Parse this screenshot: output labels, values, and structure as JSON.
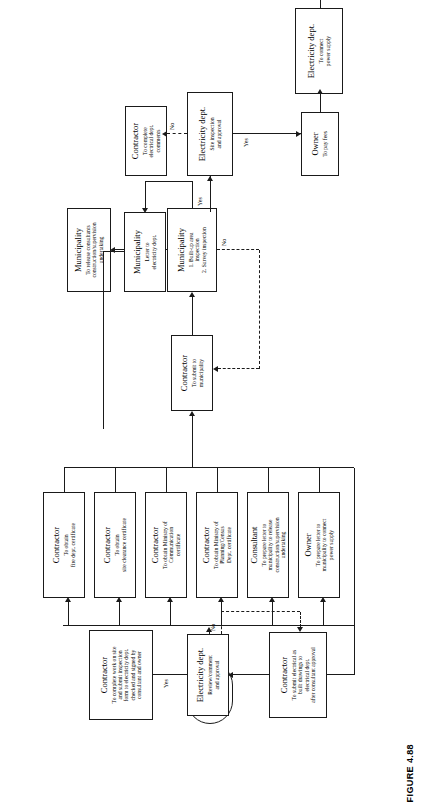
{
  "figure": {
    "caption": "FIGURE 4.88"
  },
  "diagram": {
    "orientation": "rotated-90-ccw",
    "type": "flowchart",
    "start": {
      "label": "Start"
    },
    "end": {
      "label": "End"
    },
    "nodes": [
      {
        "id": "contractor-fire",
        "title": "Contractor",
        "lines": [
          "To obtain",
          "fire dept. certificate"
        ]
      },
      {
        "id": "contractor-site",
        "title": "Contractor",
        "lines": [
          "To obtain",
          "site clearance certificate"
        ]
      },
      {
        "id": "contractor-comm",
        "title": "Contractor",
        "lines": [
          "To obtain Ministry of",
          "Communication",
          "certificate"
        ]
      },
      {
        "id": "contractor-planning",
        "title": "Contractor",
        "lines": [
          "To obtain Ministry of",
          "Planning/Census",
          "Dept. certificate"
        ]
      },
      {
        "id": "consultant-release",
        "title": "Consultant",
        "lines": [
          "To prepare letter to",
          "municipality to release",
          "construction/supervision",
          "undertaking"
        ]
      },
      {
        "id": "owner-connect",
        "title": "Owner",
        "lines": [
          "To prepare letter to",
          "municipality to connect",
          "power supply"
        ]
      },
      {
        "id": "contractor-asbuilt",
        "title": "Contractor",
        "lines": [
          "To submit electrical as",
          "built drawings to",
          "electrical dept.",
          "after consultant approval"
        ]
      },
      {
        "id": "elec-review",
        "title": "Electricity dept.",
        "lines": [
          "Review/comment",
          "and approval"
        ]
      },
      {
        "id": "contractor-complete",
        "title": "Contractor",
        "lines": [
          "To complete work on site",
          "and submit inspection",
          "form to electricity dept.",
          "checked and signed by",
          "consultant and owner"
        ]
      },
      {
        "id": "elec-site-inspection",
        "title": "Electricity dept.",
        "lines": [
          "Site inspection",
          "and approval"
        ]
      },
      {
        "id": "contractor-comments",
        "title": "Contractor",
        "lines": [
          "To complete",
          "electrical dept.",
          "comments"
        ]
      },
      {
        "id": "contractor-submit-muni",
        "title": "Contractor",
        "lines": [
          "To submit to",
          "municipality"
        ]
      },
      {
        "id": "municipality-inspect",
        "title": "Municipality",
        "lines": [
          "1. Built-up area",
          "inspection",
          "2. Survey inspection"
        ]
      },
      {
        "id": "municipality-release",
        "title": "Municipality",
        "lines": [
          "To release consultants",
          "construction/supervision",
          "undertaking"
        ]
      },
      {
        "id": "municipality-letter",
        "title": "Municipality",
        "lines": [
          "Letter to",
          "electricity dept."
        ]
      },
      {
        "id": "owner-fees",
        "title": "Owner",
        "lines": [
          "To pay fees"
        ]
      },
      {
        "id": "elec-connect",
        "title": "Electricity dept.",
        "lines": [
          "To connect",
          "power supply"
        ]
      }
    ],
    "edge_labels": {
      "elec_review_yes": "Yes",
      "elec_review_no": "No",
      "elec_inspection_yes_in": "Yes",
      "elec_inspection_no": "No",
      "elec_inspection_yes_out": "Yes",
      "municipality_no": "No"
    },
    "colors": {
      "stroke": "#1a1a1a",
      "fill": "#ffffff"
    }
  }
}
